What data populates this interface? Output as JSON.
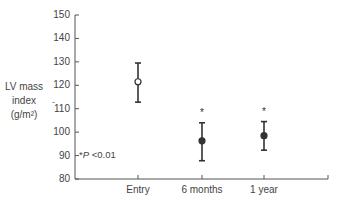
{
  "chart_data": {
    "type": "scatter",
    "title": "",
    "xlabel": "",
    "ylabel": "LV mass index (g/m²)",
    "ylabel_lines": [
      "LV mass",
      "index",
      "(g/m²)"
    ],
    "ylim": [
      80,
      150
    ],
    "yticks": [
      80,
      90,
      100,
      110,
      120,
      130,
      140,
      150
    ],
    "categories": [
      "Entry",
      "6 months",
      "1 year"
    ],
    "series": [
      {
        "name": "LV mass index",
        "values": [
          121.5,
          96.3,
          98.5
        ],
        "error_upper": [
          129.5,
          104.0,
          104.5
        ],
        "error_lower": [
          112.8,
          87.8,
          92.3
        ],
        "markers": [
          "open-circle",
          "filled-circle",
          "filled-circle"
        ],
        "significance": [
          "",
          "*",
          "*"
        ]
      }
    ],
    "annotations": [
      "*P <0.01"
    ],
    "grid": false,
    "legend": null
  },
  "axis": {
    "y_tick_labels": [
      "150",
      "140",
      "130",
      "120",
      "110",
      "100",
      "90",
      "80"
    ],
    "x_tick_labels": [
      "Entry",
      "6 months",
      "1 year"
    ]
  },
  "ylabel": {
    "line1": "LV mass",
    "line2": "index",
    "line3": "(g/m²)"
  },
  "note": {
    "star": "*",
    "p": "P",
    "rest": " <0.01"
  },
  "colors": {
    "axis": "#555555",
    "marker": "#333333",
    "text": "#444444"
  }
}
